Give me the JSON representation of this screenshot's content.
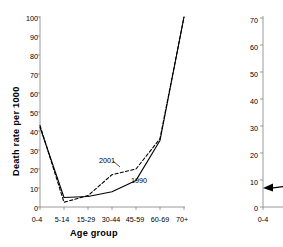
{
  "figure": {
    "background": "#ffffff",
    "ink": "#000000"
  },
  "chart_data": [
    {
      "type": "line",
      "id": "death-rate-by-age",
      "title": "",
      "xlabel": "Age group",
      "ylabel": "Death rate per 1000",
      "categories": [
        "0-4",
        "5-14",
        "15-29",
        "30-44",
        "45-59",
        "60-69",
        "70+"
      ],
      "ylim": [
        0,
        100
      ],
      "yticks": [
        0,
        10,
        20,
        30,
        40,
        50,
        60,
        70,
        80,
        90,
        100
      ],
      "grid": false,
      "legend_position": "inline-annotations",
      "series": [
        {
          "name": "1990",
          "style": "solid",
          "color": "#000000",
          "values": [
            42,
            5,
            5.5,
            8,
            14,
            35,
            100
          ]
        },
        {
          "name": "2001",
          "style": "dashed",
          "color": "#000000",
          "values": [
            43,
            2.5,
            6,
            17,
            20,
            36,
            100
          ]
        }
      ],
      "annotations": [
        {
          "text": "2001",
          "x_category": "30-44",
          "y": 22
        },
        {
          "text": "1990",
          "x_category": "45-59",
          "y": 10
        }
      ]
    },
    {
      "type": "line",
      "id": "aids-related-deaths-per-cent",
      "title": "",
      "xlabel": "",
      "ylabel": "Per cent of deaths which are AIDS related",
      "categories": [
        "0-4"
      ],
      "ylim": [
        0,
        70
      ],
      "yticks": [
        0,
        10,
        20,
        30,
        40,
        50,
        60,
        70
      ],
      "grid": false,
      "clipped": "right edge of screenshot",
      "series": [
        {
          "name": "aids-related",
          "style": "solid-with-arrow-marker",
          "color": "#000000",
          "values": [
            7
          ]
        }
      ]
    }
  ],
  "left_chart": {
    "ylabel": "Death rate per 1000",
    "xlabel": "Age group",
    "yticks": [
      "0",
      "10",
      "20",
      "30",
      "40",
      "50",
      "60",
      "70",
      "80",
      "90",
      "100"
    ],
    "xticks": [
      "0-4",
      "5-14",
      "15-29",
      "30-44",
      "45-59",
      "60-69",
      "70+"
    ],
    "series_label_2001": "2001",
    "series_label_1990": "1990"
  },
  "right_chart": {
    "ylabel": "Per cent of deaths which are AIDS related",
    "yticks": [
      "0",
      "10",
      "20",
      "30",
      "40",
      "50",
      "60",
      "70"
    ],
    "xticks": [
      "0-4"
    ]
  }
}
